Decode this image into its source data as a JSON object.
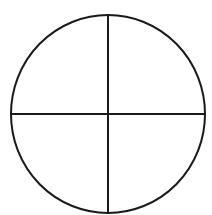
{
  "diagram": {
    "stroke_color": "#1a1a1a",
    "background": "#ffffff",
    "circle": {
      "cx": 108,
      "cy": 114,
      "rx": 97,
      "ry": 99,
      "stroke_width": 2
    },
    "vertical_line": {
      "x1": 108,
      "y1": 15,
      "x2": 108,
      "y2": 213,
      "stroke_width": 2
    },
    "horizontal_line": {
      "x1": 11,
      "y1": 114,
      "x2": 205,
      "y2": 114,
      "stroke_width": 2
    }
  }
}
